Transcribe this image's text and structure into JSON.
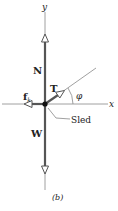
{
  "diagram": {
    "caption": "(b)",
    "axes": {
      "x_label": "x",
      "y_label": "y"
    },
    "forces": [
      {
        "id": "normal",
        "label": "N",
        "direction": "up"
      },
      {
        "id": "weight",
        "label": "W",
        "direction": "down"
      },
      {
        "id": "friction",
        "label": "f",
        "subscript": "k",
        "direction": "left"
      },
      {
        "id": "tension",
        "label": "T",
        "direction": "up-right at angle phi"
      }
    ],
    "angle_label": "φ",
    "body_label": "Sled",
    "colors": {
      "vector": "#555555",
      "axis": "#888888",
      "text": "#222222",
      "body_dot": "#111111"
    }
  }
}
